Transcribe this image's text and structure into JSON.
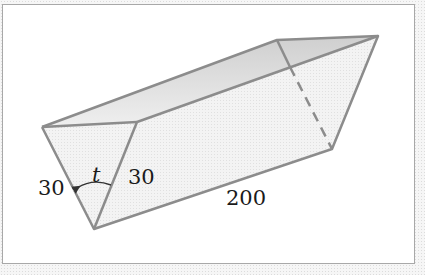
{
  "diagram": {
    "type": "triangular-prism",
    "labels": {
      "left_side": "30",
      "right_side": "30",
      "length": "200",
      "angle": "t"
    },
    "colors": {
      "edge": "#8c8c8c",
      "face_top": "#d4d4d4",
      "face_front": "#ececec",
      "face_side": "#f6f6f6",
      "frame_border": "#a8a8a8",
      "text": "#1a1a1a"
    }
  }
}
